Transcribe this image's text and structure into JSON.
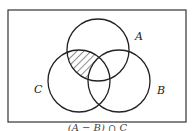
{
  "diagram": {
    "type": "venn",
    "sets": [
      {
        "name": "A",
        "cx": 98,
        "cy": 50,
        "r": 31
      },
      {
        "name": "B",
        "cx": 119,
        "cy": 81,
        "r": 31
      },
      {
        "name": "C",
        "cx": 79,
        "cy": 81,
        "r": 31
      }
    ],
    "labels": {
      "a": "A",
      "b": "B",
      "c": "C"
    },
    "shaded_region": "(A ∩ C) − B",
    "caption": "(A − B) ∩ C",
    "colors": {
      "stroke": "#222222",
      "background": "#ffffff"
    }
  }
}
